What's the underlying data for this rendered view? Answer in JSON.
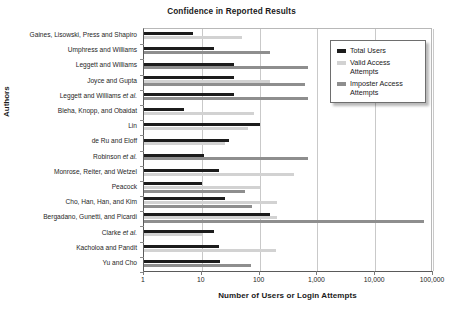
{
  "chart_data": {
    "type": "bar",
    "orientation": "horizontal",
    "title": "Confidence in Reported Results",
    "xlabel": "Number of Users or Login Attempts",
    "ylabel": "Authors",
    "xscale": "log",
    "xlim": [
      1,
      100000
    ],
    "xticks": [
      1,
      10,
      100,
      1000,
      10000,
      100000
    ],
    "xtick_labels": [
      "1",
      "10",
      "100",
      "1,000",
      "10,000",
      "100,000"
    ],
    "grid": true,
    "grid_axis": "x",
    "legend_position": "top-right",
    "categories": [
      "Gaines, Lisowski, Press and Shapiro",
      "Umphress and Williams",
      "Leggett and Williams",
      "Joyce and Gupta",
      "Leggett and Williams et al.",
      "Bleha, Knopp, and Obaidat",
      "Lin",
      "de Ru and Eloff",
      "Robinson et al.",
      "Monrose, Reiter, and Wetzel",
      "Peacock",
      "Cho, Han, Han, and Kim",
      "Bergadano, Gunetti, and Picardi",
      "Clarke et al.",
      "Kacholoa and Pandit",
      "Yu and Cho"
    ],
    "series": [
      {
        "name": "Total Users",
        "color": "#1c1c1c",
        "values": [
          7,
          16,
          36,
          36,
          36,
          5,
          100,
          30,
          11,
          20,
          10,
          25,
          150,
          16,
          20,
          21
        ]
      },
      {
        "name": "Valid Access Attempts",
        "color": "#d2d2d2",
        "values": [
          50,
          null,
          null,
          150,
          null,
          80,
          63,
          25,
          null,
          400,
          100,
          200,
          200,
          10,
          190,
          null
        ]
      },
      {
        "name": "Imposter Access Attempts",
        "color": "#8e8e8e",
        "values": [
          null,
          150,
          700,
          600,
          700,
          null,
          null,
          null,
          700,
          null,
          55,
          75,
          70000,
          null,
          null,
          70
        ]
      }
    ]
  },
  "legend": {
    "items": [
      {
        "label": "Total Users",
        "swatch": "total"
      },
      {
        "label": "Valid Access\nAttempts",
        "swatch": "valid"
      },
      {
        "label": "Imposter Access\nAttempts",
        "swatch": "imposter"
      }
    ]
  }
}
